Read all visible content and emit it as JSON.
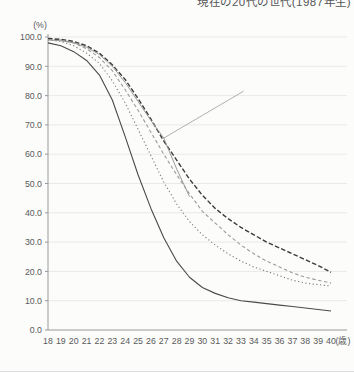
{
  "page": {
    "background": "#fcfcfb"
  },
  "header": {
    "top_label": "現在の20代の世代(1987年生)"
  },
  "chart_data": {
    "type": "line",
    "title": "",
    "y_unit_label": "(%)",
    "x_unit_label": "(歳)",
    "grid": true,
    "legend_position": "none",
    "ylim": [
      0,
      100
    ],
    "ytick_labels": [
      "0.0",
      "10.0",
      "20.0",
      "30.0",
      "40.0",
      "50.0",
      "60.0",
      "70.0",
      "80.0",
      "90.0",
      "100.0"
    ],
    "x": [
      18,
      19,
      20,
      21,
      22,
      23,
      24,
      25,
      26,
      27,
      28,
      29,
      30,
      31,
      32,
      33,
      34,
      35,
      36,
      37,
      38,
      39,
      40
    ],
    "xtick_labels": [
      "18",
      "19",
      "20",
      "21",
      "22",
      "23",
      "24",
      "25",
      "26",
      "27",
      "28",
      "29",
      "30",
      "31",
      "32",
      "33",
      "34",
      "35",
      "36",
      "37",
      "38",
      "39",
      "40"
    ],
    "series": [
      {
        "name": "cohort-oldest-solid",
        "style": "solid",
        "color": "#4a4a4a",
        "width": 1.1,
        "values": [
          98,
          97,
          95,
          92,
          87,
          78.5,
          66,
          53,
          41.5,
          31.5,
          23.5,
          18,
          14.5,
          12.5,
          11,
          10,
          9.5,
          9,
          8.5,
          8,
          7.5,
          7,
          6.5
        ]
      },
      {
        "name": "cohort-dotted",
        "style": "dotted",
        "color": "#787878",
        "width": 1.1,
        "values": [
          99,
          98.5,
          97,
          94.5,
          91,
          85,
          77.5,
          68.5,
          59.5,
          50.5,
          43,
          37,
          32.5,
          29,
          26,
          23.5,
          21.5,
          20,
          18.5,
          17,
          16,
          15.5,
          15
        ]
      },
      {
        "name": "cohort-dashed-gray",
        "style": "dashed-short",
        "color": "#9b9b9b",
        "width": 1.1,
        "values": [
          99.3,
          99,
          98,
          96,
          93,
          88.5,
          82,
          75,
          67.5,
          60,
          53,
          46.5,
          40.5,
          36.5,
          32.5,
          29,
          26,
          23.5,
          21.5,
          19.5,
          18,
          17,
          16
        ]
      },
      {
        "name": "cohort-dashed-dark",
        "style": "dashed",
        "color": "#3d3d3d",
        "width": 1.4,
        "values": [
          99.5,
          99.2,
          98.5,
          97,
          94.5,
          90.5,
          85.5,
          79,
          72,
          64.5,
          58,
          51.5,
          46,
          41.5,
          38,
          35,
          32.5,
          30,
          28,
          26,
          24,
          22,
          19.7
        ]
      },
      {
        "name": "cohort-1987-truncated",
        "style": "solid",
        "color": "#999999",
        "width": 1.0,
        "values": [
          99,
          98.7,
          98,
          96.5,
          94,
          90,
          84.5,
          78,
          71.5,
          65.5,
          55,
          45.5,
          null,
          null,
          null,
          null,
          null,
          null,
          null,
          null,
          null,
          null,
          null
        ]
      }
    ],
    "annotation_leader": {
      "from": {
        "age": 27,
        "value": 65.5
      },
      "to": {
        "age": 33.2,
        "value": 81.5
      },
      "color": "#a8a8a8"
    }
  }
}
